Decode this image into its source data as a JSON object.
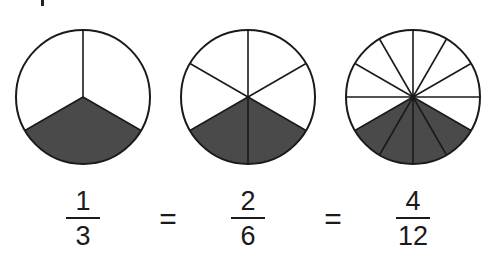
{
  "diagram": {
    "colors": {
      "outline": "#1a1a1a",
      "shade": "#4a4a4a",
      "background": "#ffffff"
    },
    "circles": [
      {
        "id": "thirds",
        "cx": 83,
        "cy": 97,
        "r": 67,
        "parts": 3,
        "shaded": 1
      },
      {
        "id": "sixths",
        "cx": 248,
        "cy": 97,
        "r": 67,
        "parts": 6,
        "shaded": 2
      },
      {
        "id": "twelfths",
        "cx": 413,
        "cy": 97,
        "r": 67,
        "parts": 12,
        "shaded": 4
      }
    ],
    "fractions": [
      {
        "numerator": "1",
        "denominator": "3"
      },
      {
        "numerator": "2",
        "denominator": "6"
      },
      {
        "numerator": "4",
        "denominator": "12"
      }
    ],
    "equals": [
      "=",
      "="
    ]
  }
}
